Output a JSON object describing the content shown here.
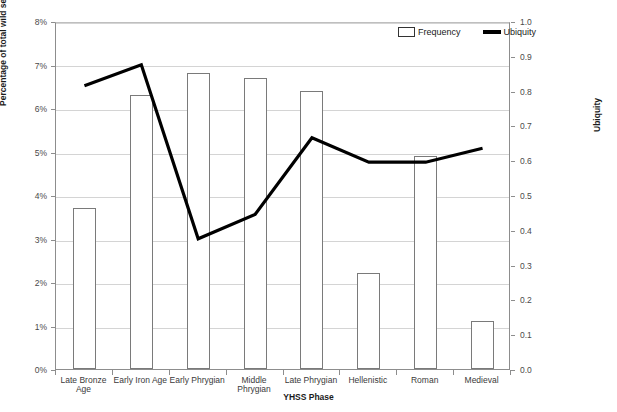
{
  "chart_data": {
    "type": "bar",
    "title": "",
    "xlabel": "YHSS Phase",
    "ylabel": "Percentage of total wild seeds",
    "y2label": "Ubiquity",
    "categories": [
      "Late Bronze Age",
      "Early Iron Age",
      "Early Phrygian",
      "Middle Phrygian",
      "Late Phrygian",
      "Hellenistic",
      "Roman",
      "Medieval"
    ],
    "ylim": [
      0,
      0.08
    ],
    "y2lim": [
      0,
      1.0
    ],
    "grid": true,
    "legend_position": "top-right",
    "ytick_labels": [
      "0%",
      "1%",
      "2%",
      "3%",
      "4%",
      "5%",
      "6%",
      "7%",
      "8%"
    ],
    "ytick_values": [
      0,
      0.01,
      0.02,
      0.03,
      0.04,
      0.05,
      0.06,
      0.07,
      0.08
    ],
    "y2tick_labels": [
      "0.0",
      "0.1",
      "0.2",
      "0.3",
      "0.4",
      "0.5",
      "0.6",
      "0.7",
      "0.8",
      "0.9",
      "1.0"
    ],
    "y2tick_values": [
      0,
      0.1,
      0.2,
      0.3,
      0.4,
      0.5,
      0.6,
      0.7,
      0.8,
      0.9,
      1.0
    ],
    "series": [
      {
        "name": "Frequency",
        "type": "bar",
        "axis": "left",
        "color": "#ffffff",
        "edge_color": "#7a7a7a",
        "values": [
          0.037,
          0.063,
          0.068,
          0.067,
          0.064,
          0.022,
          0.049,
          0.011
        ]
      },
      {
        "name": "Ubiquity",
        "type": "line",
        "axis": "right",
        "color": "#000000",
        "values": [
          0.82,
          0.88,
          0.38,
          0.45,
          0.67,
          0.6,
          0.6,
          0.64
        ]
      }
    ]
  },
  "legend": {
    "frequency_label": "Frequency",
    "ubiquity_label": "Ubiquity"
  }
}
